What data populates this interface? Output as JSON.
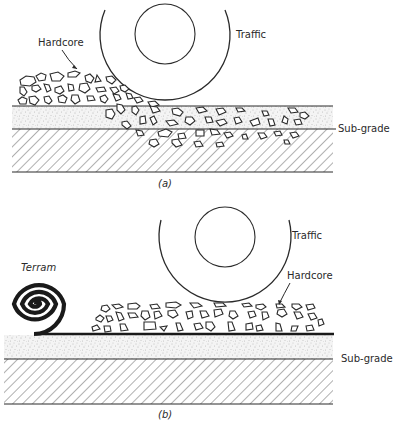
{
  "figure": {
    "panel_a": {
      "caption": "(a)",
      "labels": {
        "traffic": "Traffic",
        "hardcore": "Hardcore",
        "subgrade": "Sub-grade"
      },
      "description": "Hardcore laid directly on sub-grade; wheel load pushes stones down through sandy layer into the sub-grade"
    },
    "panel_b": {
      "caption": "(b)",
      "labels": {
        "traffic": "Traffic",
        "hardcore": "Hardcore",
        "subgrade": "Sub-grade",
        "terram": "Terram"
      },
      "description": "Terram geotextile membrane unrolled between hardcore and sub-grade keeps stones separated"
    }
  },
  "colors": {
    "ink": "#2a2a2a",
    "background": "#ffffff",
    "sand_dots": "#8a8a8a"
  }
}
